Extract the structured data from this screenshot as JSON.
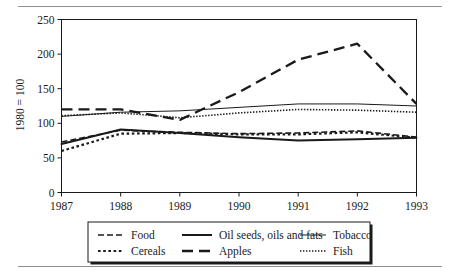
{
  "figure": {
    "has_top_rule": true,
    "has_bottom_rule": true,
    "background": "#ffffff",
    "line_color": "#1a1a1a"
  },
  "chart_data": {
    "type": "line",
    "title": "",
    "xlabel": "",
    "ylabel": "1980 = 100",
    "x": [
      1987,
      1988,
      1989,
      1990,
      1991,
      1992,
      1993
    ],
    "xtick_labels": [
      "1987",
      "1988",
      "1989",
      "1990",
      "1991",
      "1992",
      "1993"
    ],
    "ytick_labels": [
      "0",
      "50",
      "100",
      "150",
      "200",
      "250"
    ],
    "yticks": [
      0,
      50,
      100,
      150,
      200,
      250
    ],
    "ylim": [
      0,
      250
    ],
    "xlim": [
      1987,
      1993
    ],
    "grid": false,
    "legend_position": "bottom",
    "series": [
      {
        "name": "Food",
        "style": "dashed",
        "width": 1.6,
        "dash": "6,3",
        "values": [
          73,
          90,
          87,
          85,
          86,
          89,
          80
        ]
      },
      {
        "name": "Cereals",
        "style": "dotted-thick",
        "width": 2.2,
        "dash": "2.6,2.6",
        "values": [
          60,
          85,
          86,
          84,
          84,
          87,
          79
        ]
      },
      {
        "name": "Oil seeds, oils and fats",
        "style": "solid-thick",
        "width": 2.0,
        "dash": "",
        "values": [
          70,
          91,
          86,
          80,
          75,
          77,
          79
        ]
      },
      {
        "name": "Apples",
        "style": "long-dashed",
        "width": 2.3,
        "dash": "11,6",
        "values": [
          120,
          120,
          105,
          145,
          192,
          215,
          128
        ]
      },
      {
        "name": "Tobacco",
        "style": "solid-thin",
        "width": 1.0,
        "dash": "",
        "values": [
          110,
          116,
          118,
          123,
          128,
          128,
          125
        ]
      },
      {
        "name": "Fish",
        "style": "fine-dotted",
        "width": 1.6,
        "dash": "1.4,1.6",
        "values": [
          111,
          115,
          108,
          115,
          120,
          119,
          116
        ]
      }
    ]
  },
  "legend": {
    "items": [
      {
        "label": "Food",
        "series": "Food"
      },
      {
        "label": "Oil seeds, oils and fats",
        "series": "Oil seeds, oils and fats"
      },
      {
        "label": "Tobacco",
        "series": "Tobacco"
      },
      {
        "label": "Cereals",
        "series": "Cereals"
      },
      {
        "label": "Apples",
        "series": "Apples"
      },
      {
        "label": "Fish",
        "series": "Fish"
      }
    ]
  }
}
